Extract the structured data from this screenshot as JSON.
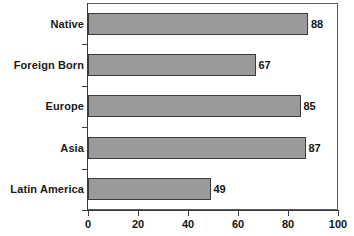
{
  "chart_data": {
    "type": "bar",
    "orientation": "horizontal",
    "title": "",
    "subtitle": "",
    "xlabel": "",
    "ylabel": "",
    "categories": [
      "Native",
      "Foreign Born",
      "Europe",
      "Asia",
      "Latin America"
    ],
    "values": [
      88,
      67,
      85,
      87,
      49
    ],
    "data_labels": [
      "88",
      "67",
      "85",
      "87",
      "49"
    ],
    "xlim": [
      0,
      100
    ],
    "xticks": [
      0,
      20,
      40,
      60,
      80,
      100
    ],
    "xtick_labels": [
      "0",
      "20",
      "40",
      "60",
      "80",
      "100"
    ],
    "grid": false,
    "legend": null,
    "colors": {
      "bar_fill": "#9a9a9a",
      "bar_border": "#3d3d3d",
      "axis": "#3b3b3b",
      "frame": "#5a5a5a",
      "text": "#141414",
      "background": "#ffffff"
    }
  }
}
